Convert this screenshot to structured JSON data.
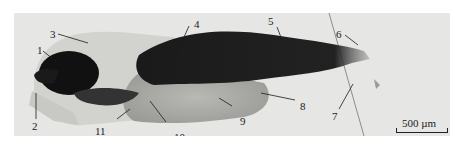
{
  "figure": {
    "labels": [
      {
        "id": "1",
        "text": "1"
      },
      {
        "id": "2",
        "text": "2"
      },
      {
        "id": "3",
        "text": "3"
      },
      {
        "id": "4",
        "text": "4"
      },
      {
        "id": "5",
        "text": "5"
      },
      {
        "id": "6",
        "text": "6"
      },
      {
        "id": "7",
        "text": "7"
      },
      {
        "id": "8",
        "text": "8"
      },
      {
        "id": "9",
        "text": "9"
      },
      {
        "id": "10",
        "text": "10"
      },
      {
        "id": "11",
        "text": "11"
      }
    ],
    "scale_bar": {
      "text": "500 µm"
    },
    "colors": {
      "background": "#e6e6e4",
      "tissue_dark": "#141414",
      "tissue_mid": "#8a8a88",
      "tissue_light": "#cfcfcc"
    }
  }
}
